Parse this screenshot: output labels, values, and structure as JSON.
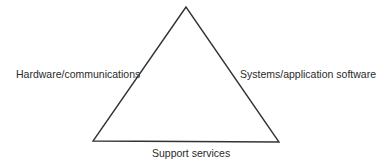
{
  "diagram": {
    "shape": "triangle",
    "stroke_color": "#333333",
    "labels": {
      "left_side": "Hardware/communications",
      "right_side": "Systems/application software",
      "bottom_side": "Support services"
    }
  }
}
